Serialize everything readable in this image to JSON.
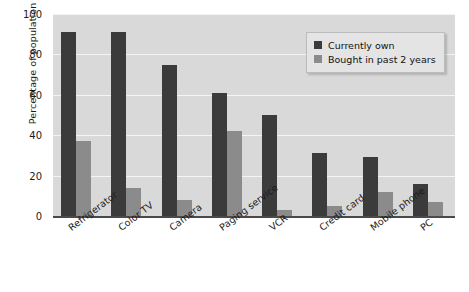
{
  "chart_data": {
    "type": "bar",
    "title": "",
    "xlabel": "",
    "ylabel": "Percentage of population",
    "ylim": [
      0,
      100
    ],
    "yticks": [
      0,
      20,
      40,
      60,
      80,
      100
    ],
    "grid": true,
    "legend_position": "top-right",
    "categories": [
      "Refrigerator",
      "Color TV",
      "Camera",
      "Paging service",
      "VCR",
      "Credit card",
      "Mobile phone",
      "PC"
    ],
    "series": [
      {
        "name": "Currently own",
        "color": "#3b3b3b",
        "values": [
          91,
          91,
          75,
          61,
          50,
          31,
          29,
          16
        ]
      },
      {
        "name": "Bought in past 2 years",
        "color": "#8b8b8b",
        "values": [
          37,
          14,
          8,
          42,
          3,
          5,
          12,
          7
        ]
      }
    ]
  },
  "legend": {
    "items": [
      {
        "label": "Currently own",
        "swatch": "own"
      },
      {
        "label": "Bought in past 2 years",
        "swatch": "bought"
      }
    ]
  },
  "colors": {
    "series_own": "#3b3b3b",
    "series_bought": "#8b8b8b",
    "plot_background": "#d9d9d9",
    "gridline": "#f4f4f4",
    "axis": "#4a4a4a",
    "legend_background": "#e4e4e4"
  }
}
